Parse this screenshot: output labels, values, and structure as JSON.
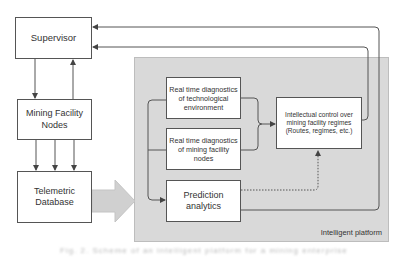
{
  "diagram": {
    "nodes": {
      "supervisor": "Supervisor",
      "mining_facility_nodes": "Mining Facility Nodes",
      "telemetric_database": "Telemetric Database",
      "rt_diag_tech_env": "Real time diagnostics of technological environment",
      "rt_diag_mining_nodes": "Real time diagnostics of mining facility nodes",
      "prediction_analytics": "Prediction analytics",
      "intellectual_control": "Intellectual control over mining facility regimes (Routes, regimes, etc.)"
    },
    "group_label": "Intelligent platform",
    "caption": "Fig. 2. Scheme of an intelligent platform for a mining enterprise",
    "edges": [
      {
        "from": "supervisor",
        "to": "mining_facility_nodes"
      },
      {
        "from": "mining_facility_nodes",
        "to": "supervisor"
      },
      {
        "from": "mining_facility_nodes",
        "to": "telemetric_database",
        "count": 3
      },
      {
        "from": "telemetric_database",
        "to": "intelligent_platform",
        "style": "block-arrow"
      },
      {
        "from": "rt_diag_tech_env",
        "to": "intellectual_control"
      },
      {
        "from": "rt_diag_mining_nodes",
        "to": "intellectual_control"
      },
      {
        "from": "prediction_analytics",
        "to": "intellectual_control",
        "style": "dotted"
      },
      {
        "from": "intellectual_control",
        "to": "supervisor"
      },
      {
        "from": "prediction_analytics",
        "to": "supervisor"
      }
    ],
    "colors": {
      "panel": "#d9d9d9",
      "line": "#555555",
      "block_arrow": "#d0d0d0"
    }
  }
}
